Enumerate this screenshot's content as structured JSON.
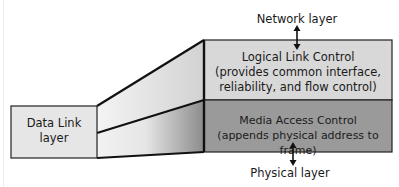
{
  "diagram": {
    "left_box": {
      "label_line1": "Data Link",
      "label_line2": "layer"
    },
    "llc": {
      "title": "Logical Link Control",
      "desc_line1": "(provides common interface,",
      "desc_line2": "reliability, and flow control)",
      "color": "#d8d8d8"
    },
    "mac": {
      "title": "Media Access Control",
      "desc_line1": "(appends physical address to frame)",
      "color": "#9a9a9a"
    },
    "top_label": "Network layer",
    "bottom_label": "Physical layer",
    "arrows": [
      "bidirectional-network-to-llc",
      "bidirectional-mac-to-physical"
    ]
  }
}
